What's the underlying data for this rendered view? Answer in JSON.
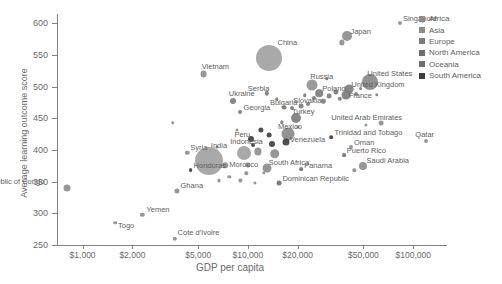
{
  "chart_data": {
    "type": "scatter",
    "title": "",
    "xlabel": "GDP per capita",
    "ylabel": "Average learning outcome score",
    "xscale": "log",
    "xlim": [
      700,
      160000
    ],
    "ylim": [
      250,
      615
    ],
    "grid": false,
    "legend_position": "top-right",
    "xticks": [
      {
        "value": 1000,
        "label": "$1,000"
      },
      {
        "value": 2000,
        "label": "$2,000"
      },
      {
        "value": 5000,
        "label": "$5,000"
      },
      {
        "value": 10000,
        "label": "$10,000"
      },
      {
        "value": 20000,
        "label": "$20,000"
      },
      {
        "value": 50000,
        "label": "$50,000"
      },
      {
        "value": 100000,
        "label": "$100,000"
      }
    ],
    "yticks": [
      {
        "value": 250,
        "label": "250"
      },
      {
        "value": 300,
        "label": "300"
      },
      {
        "value": 350,
        "label": "350"
      },
      {
        "value": 400,
        "label": "400"
      },
      {
        "value": 450,
        "label": "450"
      },
      {
        "value": 500,
        "label": "500"
      },
      {
        "value": 550,
        "label": "550"
      },
      {
        "value": 600,
        "label": "600"
      }
    ],
    "legend": [
      {
        "name": "Africa",
        "color": "#8c8c8c"
      },
      {
        "name": "Asia",
        "color": "#8c8c8c"
      },
      {
        "name": "Europe",
        "color": "#7a7a7a"
      },
      {
        "name": "North America",
        "color": "#6e6e6e"
      },
      {
        "name": "Oceania",
        "color": "#6e6e6e"
      },
      {
        "name": "South America",
        "color": "#3c3c3c"
      }
    ],
    "size_encoding": "population",
    "points": [
      {
        "name": "Democratic Republic of Congo",
        "x": 800,
        "y": 340,
        "r": 3.5,
        "region": "Africa",
        "label": "Democratic Republic of Congo",
        "lx": -124,
        "ly": -11
      },
      {
        "name": "Togo",
        "x": 1570,
        "y": 285,
        "r": 1.8,
        "region": "Africa",
        "label": "Togo",
        "lx": 3,
        "ly": -2
      },
      {
        "name": "Yemen",
        "x": 2300,
        "y": 298,
        "r": 2.2,
        "region": "Asia",
        "label": "Yemen",
        "lx": 4,
        "ly": -10
      },
      {
        "name": "Cote d'Ivoire",
        "x": 3600,
        "y": 260,
        "r": 2.2,
        "region": "Africa",
        "label": "Cote d'Ivoire",
        "lx": 3,
        "ly": -11
      },
      {
        "name": "Ghana",
        "x": 3700,
        "y": 336,
        "r": 2.6,
        "region": "Africa",
        "label": "Ghana",
        "lx": 4,
        "ly": -10
      },
      {
        "name": "Syria",
        "x": 4300,
        "y": 396,
        "r": 2.2,
        "region": "Asia",
        "label": "Syria",
        "lx": 3,
        "ly": -10
      },
      {
        "name": "Honduras",
        "x": 4500,
        "y": 368,
        "r": 1.9,
        "region": "South America",
        "label": "Honduras",
        "lx": 3,
        "ly": -9
      },
      {
        "name": "India",
        "x": 5800,
        "y": 382,
        "r": 14.0,
        "region": "Asia",
        "label": "India",
        "lx": 2,
        "ly": -20
      },
      {
        "name": "Morocco",
        "x": 7300,
        "y": 376,
        "r": 2.8,
        "region": "Africa",
        "label": "Morocco",
        "lx": 4,
        "ly": -5
      },
      {
        "name": "Indonesia",
        "x": 9500,
        "y": 395,
        "r": 7.0,
        "region": "Asia",
        "label": "Indonesia",
        "lx": -14,
        "ly": -16
      },
      {
        "name": "Peru",
        "x": 10500,
        "y": 418,
        "r": 3.0,
        "region": "South America",
        "label": "Peru",
        "lx": -17,
        "ly": -9
      },
      {
        "name": "Georgia",
        "x": 8900,
        "y": 460,
        "r": 2.0,
        "region": "Europe",
        "label": "Georgia",
        "lx": 4,
        "ly": -9
      },
      {
        "name": "Ukraine",
        "x": 8100,
        "y": 478,
        "r": 3.0,
        "region": "Europe",
        "label": "Ukraine",
        "lx": -4,
        "ly": -12
      },
      {
        "name": "Vietnam",
        "x": 5400,
        "y": 520,
        "r": 3.4,
        "region": "Asia",
        "label": "Vietnam",
        "lx": -2,
        "ly": -12
      },
      {
        "name": "China",
        "x": 13500,
        "y": 545,
        "r": 13.0,
        "region": "Asia",
        "label": "China",
        "lx": 8,
        "ly": -20
      },
      {
        "name": "Serbia",
        "x": 13000,
        "y": 490,
        "r": 2.2,
        "region": "Europe",
        "label": "Serbia",
        "lx": -19,
        "ly": -9
      },
      {
        "name": "Bulgaria",
        "x": 16500,
        "y": 467,
        "r": 2.4,
        "region": "Europe",
        "label": "Bulgaria",
        "lx": -14,
        "ly": -10
      },
      {
        "name": "Slovakia",
        "x": 21000,
        "y": 470,
        "r": 2.4,
        "region": "Europe",
        "label": "Slovakia",
        "lx": -8,
        "ly": -10
      },
      {
        "name": "Turkey",
        "x": 19500,
        "y": 450,
        "r": 5.0,
        "region": "Europe",
        "label": "Turkey",
        "lx": -4,
        "ly": -11
      },
      {
        "name": "Mexico",
        "x": 17500,
        "y": 425,
        "r": 6.5,
        "region": "North America",
        "label": "Mexico",
        "lx": -10,
        "ly": -12
      },
      {
        "name": "Venezuela",
        "x": 17000,
        "y": 412,
        "r": 3.5,
        "region": "South America",
        "label": "Venezuela",
        "lx": 4,
        "ly": -7
      },
      {
        "name": "South Africa",
        "x": 13000,
        "y": 372,
        "r": 4.5,
        "region": "Africa",
        "label": "South Africa",
        "lx": 2,
        "ly": -10
      },
      {
        "name": "Panama",
        "x": 21000,
        "y": 370,
        "r": 1.9,
        "region": "North America",
        "label": "Panama",
        "lx": 3,
        "ly": -8
      },
      {
        "name": "Dominican Republic",
        "x": 15500,
        "y": 348,
        "r": 2.4,
        "region": "North America",
        "label": "Dominican Republic",
        "lx": 3,
        "ly": -9
      },
      {
        "name": "Russia",
        "x": 24500,
        "y": 503,
        "r": 5.5,
        "region": "Europe",
        "label": "Russia",
        "lx": -2,
        "ly": -13
      },
      {
        "name": "Poland",
        "x": 27000,
        "y": 490,
        "r": 3.8,
        "region": "Europe",
        "label": "Poland",
        "lx": 3,
        "ly": -9
      },
      {
        "name": "France",
        "x": 39000,
        "y": 487,
        "r": 4.5,
        "region": "Europe",
        "label": "France",
        "lx": 3,
        "ly": -4
      },
      {
        "name": "United Kingdom",
        "x": 41000,
        "y": 496,
        "r": 4.4,
        "region": "Europe",
        "label": "United Kingdom",
        "lx": 2,
        "ly": -9
      },
      {
        "name": "United States",
        "x": 55000,
        "y": 507,
        "r": 8.0,
        "region": "North America",
        "label": "United States",
        "lx": -3,
        "ly": -13
      },
      {
        "name": "Japan",
        "x": 40000,
        "y": 580,
        "r": 5.0,
        "region": "Asia",
        "label": "Japan",
        "lx": 3,
        "ly": -9
      },
      {
        "name": "Singapore",
        "x": 83000,
        "y": 600,
        "r": 2.0,
        "region": "Asia",
        "label": "Singapore",
        "lx": 3,
        "ly": -9
      },
      {
        "name": "United Arab Emirates",
        "x": 64000,
        "y": 442,
        "r": 2.4,
        "region": "Asia",
        "label": "United Arab Emirates",
        "lx": -50,
        "ly": -10
      },
      {
        "name": "Trinidad and Tobago",
        "x": 32000,
        "y": 420,
        "r": 1.8,
        "region": "South America",
        "label": "Trinidad and Tobago",
        "lx": 3,
        "ly": -9
      },
      {
        "name": "Oman",
        "x": 42000,
        "y": 405,
        "r": 2.0,
        "region": "Asia",
        "label": "Oman",
        "lx": 3,
        "ly": -9
      },
      {
        "name": "Puerto Rico",
        "x": 38000,
        "y": 392,
        "r": 1.9,
        "region": "North America",
        "label": "Puerto Rico",
        "lx": 3,
        "ly": -9
      },
      {
        "name": "Saudi Arabia",
        "x": 50000,
        "y": 375,
        "r": 4.0,
        "region": "Asia",
        "label": "Saudi Arabia",
        "lx": 3,
        "ly": -10
      },
      {
        "name": "Qatar",
        "x": 120000,
        "y": 415,
        "r": 2.0,
        "region": "Asia",
        "label": "Qatar",
        "lx": -11,
        "ly": -11
      },
      {
        "name": "u1",
        "x": 3500,
        "y": 443,
        "r": 1.7,
        "region": "Asia",
        "label": "",
        "lx": 0,
        "ly": 0
      },
      {
        "name": "u2",
        "x": 6500,
        "y": 405,
        "r": 1.6,
        "region": "Africa",
        "label": "",
        "lx": 0,
        "ly": 0
      },
      {
        "name": "u3",
        "x": 7700,
        "y": 358,
        "r": 1.7,
        "region": "Africa",
        "label": "",
        "lx": 0,
        "ly": 0
      },
      {
        "name": "u4",
        "x": 9800,
        "y": 363,
        "r": 1.7,
        "region": "Africa",
        "label": "",
        "lx": 0,
        "ly": 0
      },
      {
        "name": "u5",
        "x": 11000,
        "y": 348,
        "r": 1.6,
        "region": "Africa",
        "label": "",
        "lx": 0,
        "ly": 0
      },
      {
        "name": "u6",
        "x": 8600,
        "y": 432,
        "r": 1.6,
        "region": "Asia",
        "label": "",
        "lx": 0,
        "ly": 0
      },
      {
        "name": "u7",
        "x": 12000,
        "y": 432,
        "r": 2.6,
        "region": "South America",
        "label": "",
        "lx": 0,
        "ly": 0
      },
      {
        "name": "u8",
        "x": 13500,
        "y": 424,
        "r": 2.4,
        "region": "South America",
        "label": "",
        "lx": 0,
        "ly": 0
      },
      {
        "name": "u9",
        "x": 11500,
        "y": 398,
        "r": 3.6,
        "region": "Asia",
        "label": "",
        "lx": 0,
        "ly": 0
      },
      {
        "name": "u10",
        "x": 14500,
        "y": 394,
        "r": 4.8,
        "region": "Asia",
        "label": "",
        "lx": 0,
        "ly": 0
      },
      {
        "name": "u11",
        "x": 10000,
        "y": 376,
        "r": 2.6,
        "region": "Africa",
        "label": "",
        "lx": 0,
        "ly": 0
      },
      {
        "name": "u12",
        "x": 12500,
        "y": 364,
        "r": 1.7,
        "region": "Africa",
        "label": "",
        "lx": 0,
        "ly": 0
      },
      {
        "name": "u13",
        "x": 9000,
        "y": 352,
        "r": 1.6,
        "region": "Africa",
        "label": "",
        "lx": 0,
        "ly": 0
      },
      {
        "name": "u14",
        "x": 16000,
        "y": 444,
        "r": 1.7,
        "region": "Europe",
        "label": "",
        "lx": 0,
        "ly": 0
      },
      {
        "name": "u15",
        "x": 18500,
        "y": 466,
        "r": 2.0,
        "region": "Europe",
        "label": "",
        "lx": 0,
        "ly": 0
      },
      {
        "name": "u16",
        "x": 23000,
        "y": 473,
        "r": 2.0,
        "region": "Europe",
        "label": "",
        "lx": 0,
        "ly": 0
      },
      {
        "name": "u17",
        "x": 25000,
        "y": 482,
        "r": 2.0,
        "region": "Europe",
        "label": "",
        "lx": 0,
        "ly": 0
      },
      {
        "name": "u18",
        "x": 28500,
        "y": 477,
        "r": 2.2,
        "region": "Europe",
        "label": "",
        "lx": 0,
        "ly": 0
      },
      {
        "name": "u19",
        "x": 31000,
        "y": 485,
        "r": 2.4,
        "region": "Europe",
        "label": "",
        "lx": 0,
        "ly": 0
      },
      {
        "name": "u20",
        "x": 34000,
        "y": 492,
        "r": 2.6,
        "region": "Europe",
        "label": "",
        "lx": 0,
        "ly": 0
      },
      {
        "name": "u21",
        "x": 36000,
        "y": 481,
        "r": 2.2,
        "region": "Europe",
        "label": "",
        "lx": 0,
        "ly": 0
      },
      {
        "name": "u22",
        "x": 45000,
        "y": 489,
        "r": 2.0,
        "region": "Europe",
        "label": "",
        "lx": 0,
        "ly": 0
      },
      {
        "name": "u23",
        "x": 48000,
        "y": 497,
        "r": 1.9,
        "region": "Europe",
        "label": "",
        "lx": 0,
        "ly": 0
      },
      {
        "name": "u24",
        "x": 60000,
        "y": 487,
        "r": 1.7,
        "region": "Europe",
        "label": "",
        "lx": 0,
        "ly": 0
      },
      {
        "name": "u25",
        "x": 37000,
        "y": 570,
        "r": 2.6,
        "region": "Asia",
        "label": "",
        "lx": 0,
        "ly": 0
      },
      {
        "name": "u26",
        "x": 30000,
        "y": 513,
        "r": 1.7,
        "region": "Europe",
        "label": "",
        "lx": 0,
        "ly": 0
      },
      {
        "name": "u27",
        "x": 52000,
        "y": 440,
        "r": 1.6,
        "region": "Asia",
        "label": "",
        "lx": 0,
        "ly": 0
      },
      {
        "name": "u28",
        "x": 44000,
        "y": 368,
        "r": 1.7,
        "region": "Asia",
        "label": "",
        "lx": 0,
        "ly": 0
      },
      {
        "name": "u29",
        "x": 20000,
        "y": 437,
        "r": 1.6,
        "region": "Europe",
        "label": "",
        "lx": 0,
        "ly": 0
      },
      {
        "name": "u30",
        "x": 6700,
        "y": 352,
        "r": 1.6,
        "region": "Africa",
        "label": "",
        "lx": 0,
        "ly": 0
      },
      {
        "name": "u31",
        "x": 15000,
        "y": 480,
        "r": 1.7,
        "region": "Europe",
        "label": "",
        "lx": 0,
        "ly": 0
      },
      {
        "name": "u32",
        "x": 22000,
        "y": 487,
        "r": 1.8,
        "region": "Europe",
        "label": "",
        "lx": 0,
        "ly": 0
      },
      {
        "name": "u33",
        "x": 10800,
        "y": 408,
        "r": 2.0,
        "region": "South America",
        "label": "",
        "lx": 0,
        "ly": 0
      },
      {
        "name": "u34",
        "x": 14000,
        "y": 410,
        "r": 3.0,
        "region": "South America",
        "label": "",
        "lx": 0,
        "ly": 0
      }
    ]
  }
}
